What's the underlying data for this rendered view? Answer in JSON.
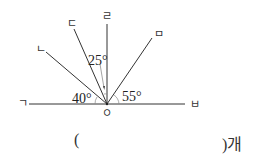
{
  "diagram": {
    "origin_label": "ㅇ",
    "rays": [
      {
        "label": "ㄱ"
      },
      {
        "label": "ㄴ"
      },
      {
        "label": "ㄷ"
      },
      {
        "label": "ㄹ"
      },
      {
        "label": "ㅁ"
      },
      {
        "label": "ㅂ"
      }
    ],
    "angles": {
      "a1": "40°",
      "a2": "25°",
      "a3": "55°"
    }
  },
  "answer": {
    "open": "(",
    "close": ")개"
  }
}
